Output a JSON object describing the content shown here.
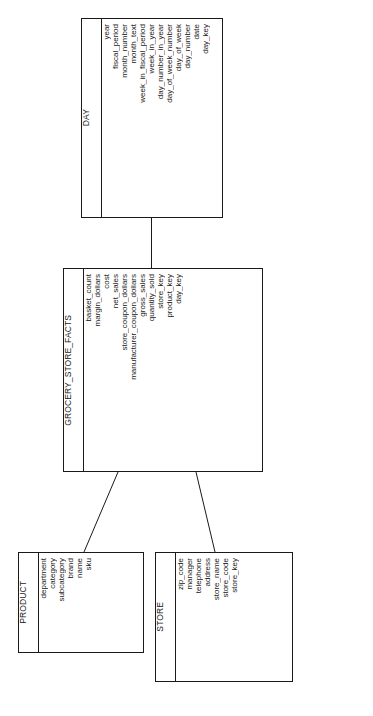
{
  "diagram": {
    "orientation": "rotated-90-ccw",
    "entities": [
      {
        "id": "day",
        "name": "DAY",
        "role": "dimension",
        "fields": [
          "day_key",
          "date",
          "day_number",
          "day_of_week",
          "day_of_week_number",
          "day_number_in_year",
          "week_in_year",
          "week_in_fiscal_period",
          "month_text",
          "month_number",
          "fiscal_period",
          "year"
        ]
      },
      {
        "id": "facts",
        "name": "GROCERY_STORE_FACTS",
        "role": "fact",
        "fields": [
          "day_key",
          "product_key",
          "store_key",
          "quantity_sold",
          "gross_sales",
          "manufacturer_coupon_dollars",
          "store_coupon_dollars",
          "net_sales",
          "cost",
          "margin_dollars",
          "basket_count"
        ]
      },
      {
        "id": "product",
        "name": "PRODUCT",
        "role": "dimension",
        "fields": [
          "sku",
          "name",
          "brand",
          "subcategory",
          "category",
          "department"
        ]
      },
      {
        "id": "store",
        "name": "STORE",
        "role": "dimension",
        "fields": [
          "store_key",
          "store_code",
          "store_name",
          "address",
          "telephone",
          "manager",
          "zip_code"
        ]
      }
    ],
    "relationships": [
      {
        "id": "day-facts",
        "from": "day",
        "to": "facts"
      },
      {
        "id": "facts-product",
        "from": "facts",
        "to": "product"
      },
      {
        "id": "facts-store",
        "from": "facts",
        "to": "store"
      }
    ],
    "colors": {
      "line": "#1a1a1a",
      "text": "#1a1a1a",
      "background": "#ffffff"
    }
  }
}
